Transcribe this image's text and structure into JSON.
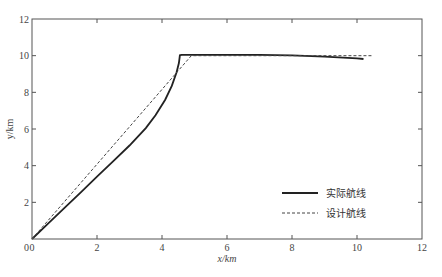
{
  "chart_data": {
    "type": "line",
    "title": "",
    "xlabel": "x/km",
    "ylabel": "y/km",
    "xlim": [
      0,
      12
    ],
    "ylim": [
      0,
      12
    ],
    "xticks": [
      0,
      2,
      4,
      6,
      8,
      10,
      12
    ],
    "yticks": [
      0,
      2,
      4,
      6,
      8,
      10,
      12
    ],
    "grid": false,
    "legend_position": "lower right",
    "series": [
      {
        "name": "实际航线",
        "style": "solid",
        "color": "#222222",
        "x": [
          0,
          0.5,
          1,
          1.5,
          2,
          2.5,
          3,
          3.5,
          3.8,
          4.1,
          4.3,
          4.45,
          4.52,
          4.55,
          4.6,
          5,
          6,
          7,
          8,
          9,
          10,
          10.2
        ],
        "y": [
          0,
          0.85,
          1.7,
          2.55,
          3.4,
          4.25,
          5.1,
          6.05,
          6.75,
          7.6,
          8.35,
          9.1,
          9.6,
          10.02,
          10.05,
          10.05,
          10.05,
          10.04,
          10.02,
          9.95,
          9.85,
          9.82
        ]
      },
      {
        "name": "设计航线",
        "style": "dashed",
        "color": "#444444",
        "x": [
          0,
          4.9,
          10.5
        ],
        "y": [
          0,
          10,
          10
        ]
      }
    ]
  }
}
